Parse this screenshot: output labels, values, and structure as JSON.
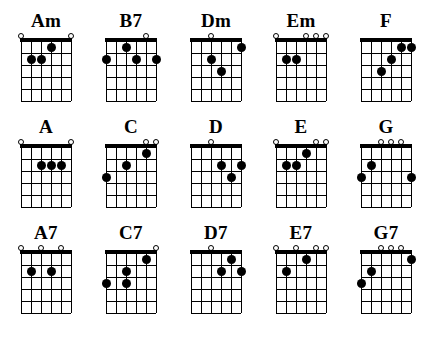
{
  "sheet": {
    "title": "Guitar Chord Diagrams",
    "strings": 6,
    "frets": 5,
    "colors": {
      "ink": "#000000",
      "paper": "#ffffff"
    },
    "markers": {
      "open_symbol": "o",
      "finger_symbol": "filled-dot"
    }
  },
  "rows": [
    {
      "chords": [
        {
          "name": "Am",
          "open_strings": [
            1,
            6
          ],
          "dots": [
            {
              "string": 4,
              "fret": 1
            },
            {
              "string": 2,
              "fret": 2
            },
            {
              "string": 3,
              "fret": 2
            }
          ]
        },
        {
          "name": "B7",
          "open_strings": [
            5
          ],
          "dots": [
            {
              "string": 3,
              "fret": 1
            },
            {
              "string": 1,
              "fret": 2
            },
            {
              "string": 4,
              "fret": 2
            },
            {
              "string": 6,
              "fret": 2
            }
          ]
        },
        {
          "name": "Dm",
          "open_strings": [
            3
          ],
          "dots": [
            {
              "string": 6,
              "fret": 1
            },
            {
              "string": 3,
              "fret": 2
            },
            {
              "string": 4,
              "fret": 3
            }
          ]
        },
        {
          "name": "Em",
          "open_strings": [
            1,
            4,
            5,
            6
          ],
          "dots": [
            {
              "string": 2,
              "fret": 2
            },
            {
              "string": 3,
              "fret": 2
            }
          ]
        },
        {
          "name": "F",
          "open_strings": [],
          "dots": [
            {
              "string": 5,
              "fret": 1
            },
            {
              "string": 6,
              "fret": 1
            },
            {
              "string": 4,
              "fret": 2
            },
            {
              "string": 3,
              "fret": 3
            }
          ]
        }
      ]
    },
    {
      "chords": [
        {
          "name": "A",
          "open_strings": [
            1,
            6
          ],
          "dots": [
            {
              "string": 3,
              "fret": 2
            },
            {
              "string": 4,
              "fret": 2
            },
            {
              "string": 5,
              "fret": 2
            }
          ]
        },
        {
          "name": "C",
          "open_strings": [
            5,
            6
          ],
          "dots": [
            {
              "string": 5,
              "fret": 1
            },
            {
              "string": 3,
              "fret": 2
            },
            {
              "string": 1,
              "fret": 3
            }
          ]
        },
        {
          "name": "D",
          "open_strings": [
            3
          ],
          "dots": [
            {
              "string": 4,
              "fret": 2
            },
            {
              "string": 6,
              "fret": 2
            },
            {
              "string": 5,
              "fret": 3
            }
          ]
        },
        {
          "name": "E",
          "open_strings": [
            1,
            5,
            6
          ],
          "dots": [
            {
              "string": 4,
              "fret": 1
            },
            {
              "string": 2,
              "fret": 2
            },
            {
              "string": 3,
              "fret": 2
            }
          ]
        },
        {
          "name": "G",
          "open_strings": [
            3,
            4,
            5
          ],
          "dots": [
            {
              "string": 2,
              "fret": 2
            },
            {
              "string": 1,
              "fret": 3
            },
            {
              "string": 6,
              "fret": 3
            }
          ]
        }
      ]
    },
    {
      "chords": [
        {
          "name": "A7",
          "open_strings": [
            1,
            3,
            5
          ],
          "dots": [
            {
              "string": 2,
              "fret": 2
            },
            {
              "string": 4,
              "fret": 2
            }
          ]
        },
        {
          "name": "C7",
          "open_strings": [
            6
          ],
          "dots": [
            {
              "string": 5,
              "fret": 1
            },
            {
              "string": 3,
              "fret": 2
            },
            {
              "string": 1,
              "fret": 3
            },
            {
              "string": 3,
              "fret": 3
            }
          ]
        },
        {
          "name": "D7",
          "open_strings": [
            3
          ],
          "dots": [
            {
              "string": 5,
              "fret": 1
            },
            {
              "string": 4,
              "fret": 2
            },
            {
              "string": 6,
              "fret": 2
            }
          ]
        },
        {
          "name": "E7",
          "open_strings": [
            1,
            3,
            5,
            6
          ],
          "dots": [
            {
              "string": 4,
              "fret": 1
            },
            {
              "string": 2,
              "fret": 2
            }
          ]
        },
        {
          "name": "G7",
          "open_strings": [
            3,
            4,
            5
          ],
          "dots": [
            {
              "string": 6,
              "fret": 1
            },
            {
              "string": 2,
              "fret": 2
            },
            {
              "string": 1,
              "fret": 3
            }
          ]
        }
      ]
    }
  ]
}
